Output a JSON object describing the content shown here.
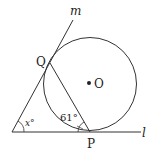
{
  "diagram": {
    "labels": {
      "line_m": "m",
      "line_l": "l",
      "point_Q": "Q",
      "point_P": "P",
      "center_O": "O",
      "angle_x": "x°",
      "angle_61": "61°"
    },
    "colors": {
      "stroke": "#333333",
      "background": "#ffffff"
    }
  }
}
